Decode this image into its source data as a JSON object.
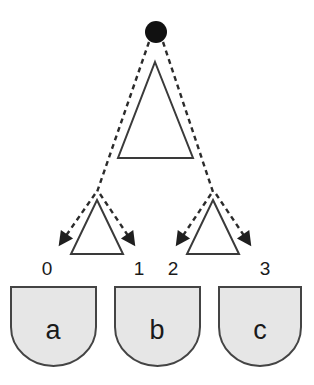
{
  "diagram": {
    "type": "tree-diagram",
    "title": "",
    "background_color": "#ffffff",
    "root": {
      "name": "root-node",
      "shape": "filled-circle",
      "color": "#111111",
      "cx": 156,
      "cy": 32,
      "r": 11
    },
    "internal_nodes": [
      {
        "id": "main-triangle",
        "shape": "triangle",
        "fill": "#ffffff",
        "stroke": "#3a3a3a",
        "apex_x": 155,
        "apex_y": 62,
        "base_left_x": 118,
        "base_right_x": 193,
        "base_y": 158
      },
      {
        "id": "left-subtriangle",
        "shape": "triangle",
        "fill": "#ffffff",
        "stroke": "#3a3a3a",
        "apex_x": 97,
        "apex_y": 200,
        "base_left_x": 71,
        "base_right_x": 123,
        "base_y": 254
      },
      {
        "id": "right-subtriangle",
        "shape": "triangle",
        "fill": "#ffffff",
        "stroke": "#3a3a3a",
        "apex_x": 213,
        "apex_y": 200,
        "base_left_x": 187,
        "base_right_x": 239,
        "base_y": 254
      }
    ],
    "edges": {
      "style": "dashed",
      "stroke": "#2b2b2b",
      "stroke_width": 2.4,
      "dash_pattern": "5,4",
      "arrowhead": "solid-triangle",
      "paths": [
        {
          "id": "edge-root-to-left-branch",
          "from": "root-node",
          "to": "left-branch-point"
        },
        {
          "id": "edge-root-to-right-branch",
          "from": "root-node",
          "to": "right-branch-point"
        },
        {
          "id": "edge-left-branch-to-leaf-0",
          "from": "left-branch-point",
          "to": "leaf-0"
        },
        {
          "id": "edge-left-branch-to-leaf-1",
          "from": "left-branch-point",
          "to": "leaf-1"
        },
        {
          "id": "edge-right-branch-to-leaf-2",
          "from": "right-branch-point",
          "to": "leaf-2"
        },
        {
          "id": "edge-right-branch-to-leaf-3",
          "from": "right-branch-point",
          "to": "leaf-3"
        }
      ]
    },
    "leaf_labels": [
      {
        "id": "leaf-index-0",
        "text": "0",
        "x": 47,
        "y": 275
      },
      {
        "id": "leaf-index-1",
        "text": "1",
        "x": 139,
        "y": 275
      },
      {
        "id": "leaf-index-2",
        "text": "2",
        "x": 173,
        "y": 275
      },
      {
        "id": "leaf-index-3",
        "text": "3",
        "x": 265,
        "y": 275
      }
    ],
    "shields": [
      {
        "id": "shield-a",
        "label": "a",
        "fill": "#e6e6e6",
        "stroke": "#444444",
        "x": 11,
        "y": 286,
        "width": 85,
        "height": 80,
        "label_x": 53,
        "label_y": 337
      },
      {
        "id": "shield-b",
        "label": "b",
        "fill": "#e6e6e6",
        "stroke": "#444444",
        "x": 115,
        "y": 286,
        "width": 85,
        "height": 80,
        "label_x": 157,
        "label_y": 337
      },
      {
        "id": "shield-c",
        "label": "c",
        "fill": "#e6e6e6",
        "stroke": "#444444",
        "x": 219,
        "y": 286,
        "width": 82,
        "height": 80,
        "label_x": 260,
        "label_y": 337
      }
    ]
  }
}
